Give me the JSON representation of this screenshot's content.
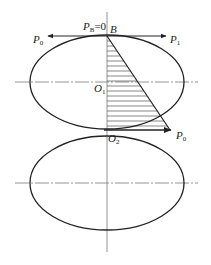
{
  "diagram": {
    "type": "pressure-distribution",
    "colors": {
      "stroke": "#222222",
      "axis": "#888888",
      "hatch": "#555555",
      "background": "#ffffff"
    },
    "labels": {
      "pb_main": "P",
      "pb_sub": "B",
      "pb_eq": "=0",
      "b": "B",
      "p0_left_main": "P",
      "p0_left_sub": "0",
      "p1_main": "P",
      "p1_sub": "1",
      "o1_main": "O",
      "o1_sub": "1",
      "o2_main": "O",
      "o2_sub": "2",
      "p0_right_main": "P",
      "p0_right_sub": "0"
    },
    "shapes": {
      "upper_ellipse": {
        "cx": 107,
        "cy": 82,
        "rx": 77,
        "ry": 47,
        "center_label": "O1"
      },
      "lower_ellipse": {
        "cx": 107,
        "cy": 183,
        "rx": 77,
        "ry": 47,
        "center_label": "O2"
      },
      "pressure_triangle": {
        "apex": "B",
        "base_from": "O2",
        "base_to_label": "P0"
      }
    }
  }
}
